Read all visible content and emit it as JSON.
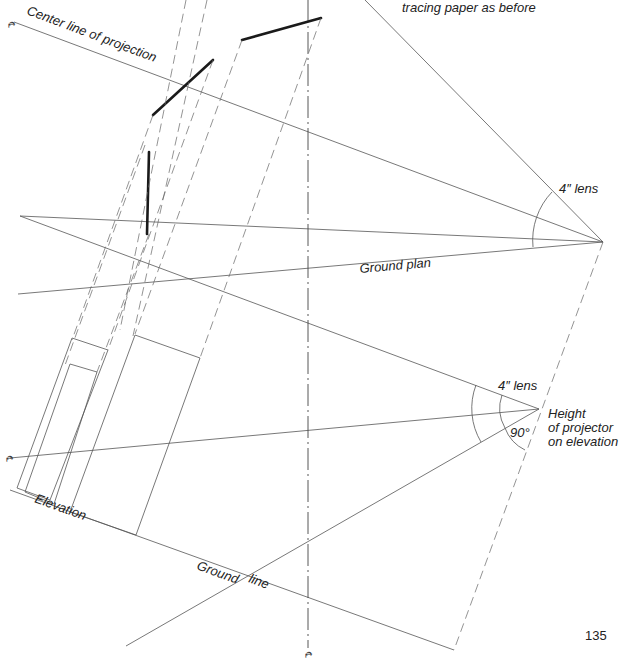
{
  "figure": {
    "type": "orthographic projection drawing (projector plan & elevation)",
    "colors": {
      "line": "#555555",
      "heavy": "#1a1a1a",
      "text": "#222222",
      "background": "#ffffff"
    }
  },
  "labels": {
    "top_note": "tracing paper as before",
    "center_line": "Center line of projection",
    "lens_plan": "4″ lens",
    "ground_plan": "Ground plan",
    "lens_elevation": "4″ lens",
    "height_line1": "Height",
    "height_line2": "of projector",
    "height_line3": "on elevation",
    "angle": "90°",
    "elevation": "Elevation",
    "ground_word": "Ground",
    "line_word": "line",
    "page_number": "135"
  },
  "symbols": {
    "centerline_mark": "℄"
  }
}
